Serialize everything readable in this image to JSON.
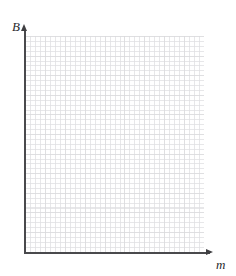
{
  "figure": {
    "kind": "empty-coordinate-grid",
    "background_color": "#ffffff"
  },
  "axes": {
    "y": {
      "label": "B",
      "label_style": "italic",
      "arrow": "up",
      "line_color": "#4a4a4d",
      "arrow_icon_name": "arrow-up-icon"
    },
    "x": {
      "label": "m",
      "label_style": "italic",
      "arrow": "right",
      "line_color": "#4a4a4d",
      "arrow_icon_name": "arrow-right-icon"
    }
  },
  "grid": {
    "visible": true,
    "style": "dotted",
    "minor_color": "#b9b9c0",
    "major_color": "#aaaaaf",
    "minor_cell_px": 5,
    "major_cell_px": 20,
    "columns_major": 9,
    "rows_major": 11,
    "left_px": 25,
    "top_px": 36,
    "width_px": 179,
    "height_px": 216
  },
  "chart_data": {
    "type": "scatter",
    "title": "",
    "xlabel": "m",
    "ylabel": "B",
    "series": [
      {
        "name": "",
        "x": [],
        "y": []
      }
    ],
    "x": [],
    "values": [],
    "categories": [],
    "xlim": [
      0,
      9
    ],
    "ylim": [
      0,
      11
    ],
    "xticks": [],
    "yticks": [],
    "xticklabels": [],
    "yticklabels": [],
    "grid": true,
    "legend": false,
    "annotations": [],
    "note": "Blank graph paper: axes labelled B (vertical) and m (horizontal); no plotted data points, no tick labels."
  }
}
